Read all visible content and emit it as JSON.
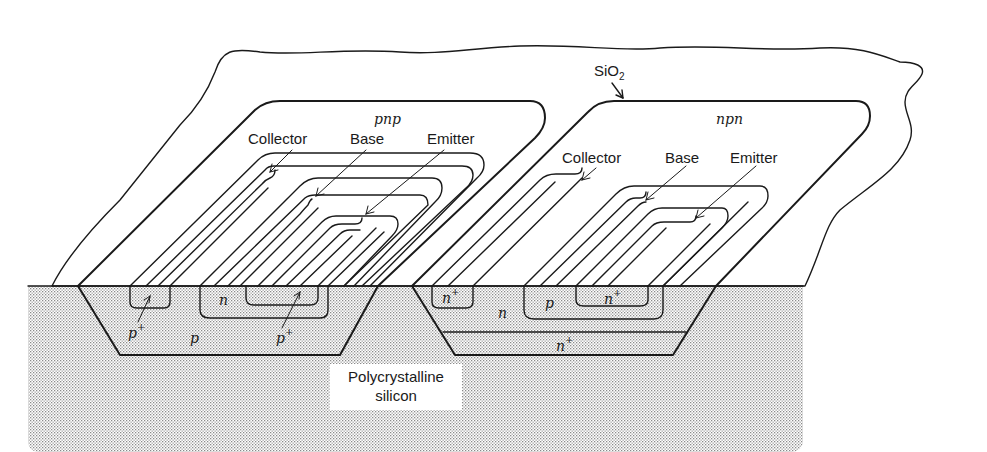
{
  "diagram": {
    "type": "cross-section",
    "oxide_label": "SiO",
    "oxide_subscript": "2",
    "substrate_label_line1": "Polycrystalline",
    "substrate_label_line2": "silicon",
    "devices": [
      {
        "name": "pnp",
        "terminals": [
          "Collector",
          "Base",
          "Emitter"
        ],
        "regions": {
          "tub": "p",
          "collector_contact": "p",
          "collector_contact_sup": "+",
          "base": "n",
          "emitter": "p",
          "emitter_sup": "+"
        }
      },
      {
        "name": "npn",
        "terminals": [
          "Collector",
          "Base",
          "Emitter"
        ],
        "regions": {
          "tub": "n",
          "collector_contact": "n",
          "collector_contact_sup": "+",
          "base": "p",
          "emitter": "n",
          "emitter_sup": "+",
          "buried_layer": "n",
          "buried_layer_sup": "+"
        }
      }
    ],
    "colors": {
      "line": "#1a1a1a",
      "stipple": "#9a9a9a",
      "background": "#ffffff"
    }
  }
}
